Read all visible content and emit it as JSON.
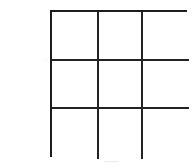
{
  "figure": {
    "kind": "3x3-grid",
    "title": "",
    "background_color": "#ffffff",
    "line_color": "#232323",
    "line_width_px": 2,
    "rows": 3,
    "columns": 3,
    "cell_count": 9,
    "cells": [
      {
        "id": "r1c1",
        "row": 1,
        "column": 1,
        "label": ""
      },
      {
        "id": "r1c2",
        "row": 1,
        "column": 2,
        "label": ""
      },
      {
        "id": "r1c3",
        "row": 1,
        "column": 3,
        "label": ""
      },
      {
        "id": "r2c1",
        "row": 2,
        "column": 1,
        "label": ""
      },
      {
        "id": "r2c2",
        "row": 2,
        "column": 2,
        "label": ""
      },
      {
        "id": "r2c3",
        "row": 2,
        "column": 3,
        "label": ""
      },
      {
        "id": "r3c1",
        "row": 3,
        "column": 1,
        "label": ""
      },
      {
        "id": "r3c2",
        "row": 3,
        "column": 2,
        "label": ""
      },
      {
        "id": "r3c3",
        "row": 3,
        "column": 3,
        "label": ""
      }
    ]
  }
}
